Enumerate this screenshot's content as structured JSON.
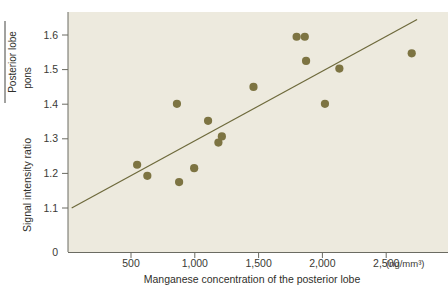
{
  "chart_data": {
    "type": "scatter",
    "title": "",
    "xlabel": "Manganese concentration of the posterior lobe",
    "xunit": "(ng/mm³)",
    "ylabel_main": "Signal intensity ratio",
    "ylabel_fraction_numerator": "Posterior lobe",
    "ylabel_fraction_denominator": "pons",
    "x_ticks": [
      500,
      1000,
      1500,
      2000,
      2500
    ],
    "x_tick_labels": [
      "500",
      "1,000",
      "1,500",
      "2,000",
      "2,500"
    ],
    "y_ticks": [
      0,
      1.1,
      1.2,
      1.3,
      1.4,
      1.5,
      1.6
    ],
    "y_tick_labels": [
      "0",
      "1.1",
      "1.2",
      "1.3",
      "1.4",
      "1.5",
      "1.6"
    ],
    "xlim": [
      0,
      2790
    ],
    "ylim_display": [
      1.04,
      1.655
    ],
    "grid": false,
    "legend": null,
    "marker_color": "#7d7442",
    "line_color": "#6e6a3c",
    "plot_background": "#edeade",
    "points": [
      {
        "x": 548,
        "y": 1.225
      },
      {
        "x": 628,
        "y": 1.193
      },
      {
        "x": 860,
        "y": 1.401
      },
      {
        "x": 877,
        "y": 1.175
      },
      {
        "x": 995,
        "y": 1.215
      },
      {
        "x": 1104,
        "y": 1.352
      },
      {
        "x": 1185,
        "y": 1.289
      },
      {
        "x": 1212,
        "y": 1.307
      },
      {
        "x": 1460,
        "y": 1.45
      },
      {
        "x": 1798,
        "y": 1.595
      },
      {
        "x": 1862,
        "y": 1.595
      },
      {
        "x": 1872,
        "y": 1.525
      },
      {
        "x": 2020,
        "y": 1.401
      },
      {
        "x": 2133,
        "y": 1.503
      },
      {
        "x": 2700,
        "y": 1.547
      }
    ],
    "trendline": {
      "x_start": 35,
      "y_start": 1.1,
      "x_end": 2742,
      "y_end": 1.645
    }
  }
}
